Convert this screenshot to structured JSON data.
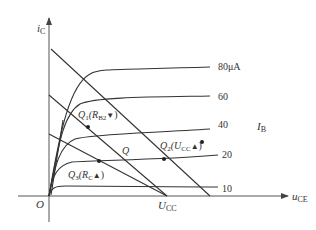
{
  "axes": {
    "y_label": "i",
    "y_sub": "C",
    "x_label": "u",
    "x_sub": "CE",
    "origin": "O"
  },
  "curves": {
    "family_label": "I",
    "family_sub": "B",
    "labels": [
      "80μA",
      "60",
      "40",
      "20",
      "10"
    ]
  },
  "annotations": {
    "ucc": "U",
    "ucc_sub": "CC",
    "q": "Q",
    "q1": "Q",
    "q1_sub": "1",
    "q1_paren_open": "(R",
    "q1_paren_sub": "B2",
    "q1_arrow": "▼",
    "q2": "Q",
    "q2_sub": "2",
    "q2_paren_open": "(U",
    "q2_paren_sub": "CC",
    "q2_arrow": "▲",
    "q3": "Q",
    "q3_sub": "3",
    "q3_paren_open": "(R",
    "q3_paren_sub": "C",
    "q3_arrow": "▲",
    "close": ")"
  }
}
